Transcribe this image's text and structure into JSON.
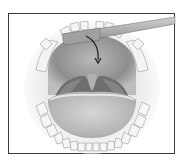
{
  "figure": {
    "style": "grayscale",
    "elements": [
      "frame-border",
      "upper-teeth",
      "lower-teeth",
      "palate",
      "uvula",
      "tonsils",
      "tongue",
      "swab-stick",
      "curved-arrow"
    ]
  },
  "colors": {
    "background": "#ffffff",
    "border": "#3a3a3a",
    "palate": "#9a9a9a",
    "throat_dark": "#6e6e6e",
    "tongue": "#c4c4c4",
    "teeth": "#f2f2f2",
    "stick": "#a8a8a8",
    "arrow": "#1a1a1a"
  }
}
